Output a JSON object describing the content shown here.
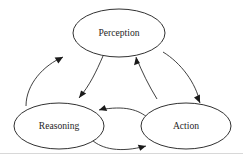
{
  "diagram": {
    "background_color": "#ffffff",
    "stroke_color": "#1a1a1a",
    "text_color": "#262626",
    "nodes": [
      {
        "id": "perception",
        "label": "Perception",
        "shape": "ellipse",
        "cx": 119,
        "cy": 33,
        "rx": 46,
        "ry": 24
      },
      {
        "id": "reasoning",
        "label": "Reasoning",
        "shape": "ellipse",
        "cx": 59,
        "cy": 126,
        "rx": 45,
        "ry": 23
      },
      {
        "id": "action",
        "label": "Action",
        "shape": "ellipse",
        "cx": 186,
        "cy": 126,
        "rx": 45,
        "ry": 23
      }
    ],
    "edges": [
      {
        "id": "reasoning-to-perception",
        "from": "reasoning",
        "to": "perception",
        "style": "curved",
        "arrowhead": "solid-triangle"
      },
      {
        "id": "perception-to-reasoning",
        "from": "perception",
        "to": "reasoning",
        "style": "curved",
        "arrowhead": "solid-triangle"
      },
      {
        "id": "action-to-perception",
        "from": "action",
        "to": "perception",
        "style": "curved",
        "arrowhead": "solid-triangle"
      },
      {
        "id": "perception-to-action",
        "from": "perception",
        "to": "action",
        "style": "curved",
        "arrowhead": "solid-triangle"
      },
      {
        "id": "action-to-reasoning",
        "from": "action",
        "to": "reasoning",
        "style": "curved",
        "arrowhead": "solid-triangle"
      },
      {
        "id": "reasoning-to-action",
        "from": "reasoning",
        "to": "action",
        "style": "curved",
        "arrowhead": "solid-triangle"
      }
    ],
    "footer_rule": {
      "visible": true,
      "color": "#d8d8d8"
    }
  }
}
